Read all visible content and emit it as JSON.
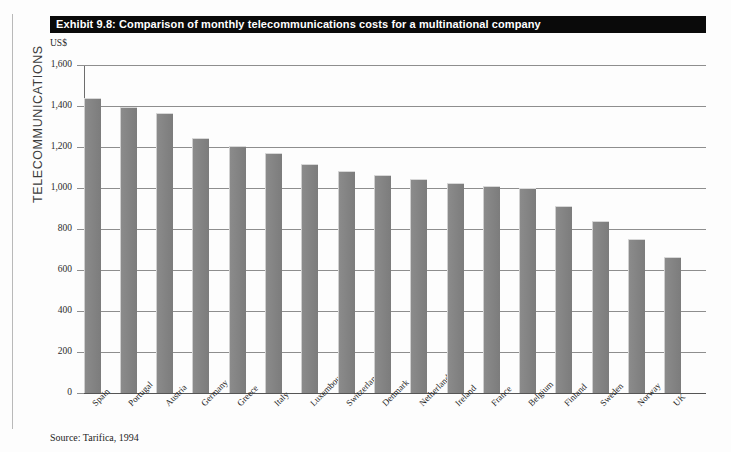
{
  "section_label": "TELECOMMUNICATIONS",
  "title": "Exhibit 9.8: Comparison of monthly telecommunications costs for a multinational company",
  "unit": "US$",
  "source": "Source: Tarifica, 1994",
  "colors": {
    "title_bar_bg": "#0a0a0a",
    "title_bar_text": "#ffffff",
    "bar_fill": "#7c7c7c",
    "gridline": "#8e8e8e",
    "page_bg": "#fdfdfd"
  },
  "chart_data": {
    "type": "bar",
    "title": "Exhibit 9.8: Comparison of monthly telecommunications costs for a multinational company",
    "subtitle": "",
    "xlabel": "",
    "ylabel": "US$",
    "ylim": [
      0,
      1600
    ],
    "yticks": [
      0,
      200,
      400,
      600,
      800,
      1000,
      1200,
      1400,
      1600
    ],
    "ytick_labels": [
      "0",
      "200",
      "400",
      "600",
      "800",
      "1,000",
      "1,200",
      "1,400",
      "1,600"
    ],
    "grid": true,
    "legend": "none",
    "categories": [
      "Spain",
      "Portugal",
      "Austria",
      "Germany",
      "Greece",
      "Italy",
      "Luxembourg",
      "Switzerland",
      "Denmark",
      "Netherlands",
      "Ireland",
      "France",
      "Belgium",
      "Finland",
      "Sweden",
      "Norway",
      "UK"
    ],
    "values": [
      1440,
      1395,
      1365,
      1245,
      1205,
      1170,
      1115,
      1085,
      1065,
      1045,
      1025,
      1010,
      1000,
      910,
      840,
      750,
      665
    ],
    "annotations": [
      "Source: Tarifica, 1994"
    ]
  }
}
